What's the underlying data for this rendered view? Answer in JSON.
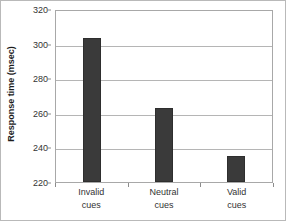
{
  "chart_data": {
    "type": "bar",
    "title": "",
    "xlabel": "",
    "ylabel": "Response time (msec)",
    "categories": [
      "Invalid cues",
      "Neutral cues",
      "Valid cues"
    ],
    "category_lines": [
      [
        "Invalid",
        "cues"
      ],
      [
        "Neutral",
        "cues"
      ],
      [
        "Valid",
        "cues"
      ]
    ],
    "values": [
      303,
      262.5,
      235
    ],
    "ylim": [
      220,
      320
    ],
    "ytick_labels": [
      "320",
      "300",
      "280",
      "260",
      "240",
      "220"
    ],
    "ytick_values": [
      320,
      300,
      280,
      260,
      240,
      220
    ],
    "grid": true,
    "legend": false,
    "colors": {
      "bar": "#3a3a3a",
      "bar_edge": "#2e2e2e",
      "gridline": "#b5b5b5",
      "plot_border": "#a8a8a8",
      "text": "#333333",
      "axis_title": "#1d1d1d",
      "background": "#ffffff"
    }
  }
}
